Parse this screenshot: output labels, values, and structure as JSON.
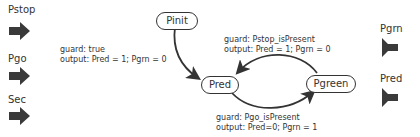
{
  "inputs": [
    {
      "label": "Pstop"
    },
    {
      "label": "Pgo"
    },
    {
      "label": "Sec"
    }
  ],
  "outputs": [
    {
      "label": "Pgrn"
    },
    {
      "label": "Pred"
    }
  ],
  "states": {
    "init": "Pinit",
    "red": "Pred",
    "green": "Pgreen"
  },
  "transitions": {
    "init_to_red": {
      "guard": "guard: true",
      "output": "output: Pred = 1; Pgrn = 0"
    },
    "green_to_red": {
      "guard": "guard: Pstop_isPresent",
      "output": "output: Pred = 1; Pgrn = 0"
    },
    "red_to_green": {
      "guard": "guard: Pgo_isPresent",
      "output": "output: Pred=0; Pgrn = 1"
    }
  },
  "colors": {
    "stroke": "#333333",
    "port_fill": "#3a3a3a"
  }
}
